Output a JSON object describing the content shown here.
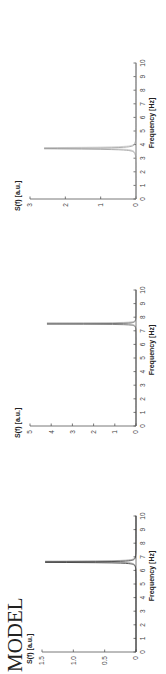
{
  "figure": {
    "title": "MODEL",
    "orientation": "rotated 90 degrees counter-clockwise"
  },
  "chart_data": [
    {
      "type": "line",
      "title": "",
      "xlabel": "Frequency [Hz]",
      "ylabel": "S(f) [a.u.]",
      "xlim": [
        0,
        10
      ],
      "ylim": [
        0,
        1.5
      ],
      "xticks": [
        "0",
        "1",
        "2",
        "3",
        "4",
        "5",
        "6",
        "7",
        "8",
        "9",
        "10"
      ],
      "yticks": [
        "0",
        "0.5",
        "1.0",
        "1.5"
      ],
      "ytick_values": [
        0,
        0.5,
        1.0,
        1.5
      ],
      "grid": false,
      "series": [
        {
          "name": "spectrum",
          "color": "#333333",
          "peak_freq": 6.6,
          "peak_height": 1.45,
          "width": 0.03,
          "double_line": true
        }
      ]
    },
    {
      "type": "line",
      "title": "",
      "xlabel": "Frequency [Hz]",
      "ylabel": "S(f) [a.u.]",
      "xlim": [
        0,
        10
      ],
      "ylim": [
        0,
        5
      ],
      "xticks": [
        "0",
        "1",
        "2",
        "3",
        "4",
        "5",
        "6",
        "7",
        "8",
        "9",
        "10"
      ],
      "yticks": [
        "0",
        "1",
        "2",
        "3",
        "4",
        "5"
      ],
      "ytick_values": [
        0,
        1,
        2,
        3,
        4,
        5
      ],
      "grid": false,
      "series": [
        {
          "name": "spectrum",
          "color": "#666666",
          "peak_freq": 7.5,
          "peak_height": 4.2,
          "width": 0.02,
          "double_line": true
        }
      ]
    },
    {
      "type": "line",
      "title": "",
      "xlabel": "Frequency [Hz]",
      "ylabel": "S(f) [a.u.]",
      "xlim": [
        0,
        10
      ],
      "ylim": [
        0,
        3
      ],
      "xticks": [
        "0",
        "1",
        "2",
        "3",
        "4",
        "5",
        "6",
        "7",
        "8",
        "9",
        "10"
      ],
      "yticks": [
        "0",
        "1",
        "2",
        "3"
      ],
      "ytick_values": [
        0,
        1,
        2,
        3
      ],
      "grid": false,
      "series": [
        {
          "name": "spectrum",
          "color": "#999999",
          "peak_freq": 3.7,
          "peak_height": 2.6,
          "width": 0.04,
          "double_line": true
        }
      ]
    }
  ]
}
